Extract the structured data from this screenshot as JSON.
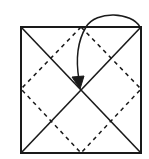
{
  "diagram": {
    "type": "origami-fold-step",
    "colors": {
      "line": "#1a1a1a",
      "background": "#ffffff"
    },
    "square": {
      "x": 21,
      "y": 27,
      "size_w": 120,
      "size_h": 126
    },
    "center": {
      "x": 81,
      "y": 89
    },
    "valley_folds": "dashed diamond connecting side midpoints",
    "creases": "solid diagonals corner to corner",
    "arrow": {
      "from": "top-right corner",
      "to": "center",
      "icon": "fold-arrow-icon"
    }
  }
}
